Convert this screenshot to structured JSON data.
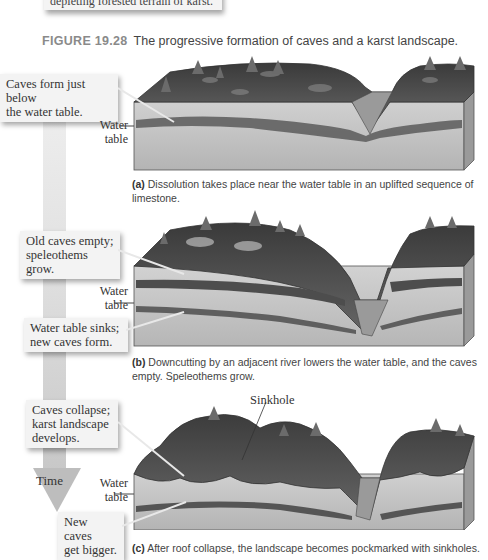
{
  "previous_box": {
    "text": "depleting forested terrain of karst."
  },
  "figure": {
    "number": "FIGURE 19.28",
    "title": "The progressive formation of caves and a karst landscape."
  },
  "time_arrow": {
    "label": "Time",
    "colors": {
      "top": "#eeeeee",
      "bottom": "#bdbdbd"
    }
  },
  "panels": [
    {
      "id": "a",
      "callouts": [
        {
          "line1": "Caves form just below",
          "line2": "the water table."
        }
      ],
      "water_table": {
        "line1": "Water",
        "line2": "table"
      },
      "caption": {
        "letter": "(a)",
        "text": " Dissolution takes place near the water table in an uplifted sequence of limestone."
      }
    },
    {
      "id": "b",
      "callouts": [
        {
          "line1": "Old caves empty;",
          "line2": "speleothems grow."
        },
        {
          "line1": "Water table sinks;",
          "line2": "new caves form."
        }
      ],
      "water_table": {
        "line1": "Water",
        "line2": "table"
      },
      "caption": {
        "letter": "(b)",
        "text": " Downcutting by an adjacent river lowers the water table, and the caves empty. Speleothems grow."
      }
    },
    {
      "id": "c",
      "callouts": [
        {
          "line1": "Caves collapse;",
          "line2": "karst landscape",
          "line3": "develops."
        },
        {
          "line1": "New caves",
          "line2": "get bigger."
        }
      ],
      "water_table": {
        "line1": "Water",
        "line2": "table"
      },
      "feature_label": "Sinkhole",
      "caption": {
        "letter": "(c)",
        "text": " After roof collapse, the landscape becomes pockmarked with sinkholes."
      }
    }
  ],
  "colors": {
    "ground_surface": "#4a4a4a",
    "limestone": "#bdbdbd",
    "limestone_light": "#d6d6d6",
    "cave_band": "#5a5a5a",
    "river": "#9a9a9a",
    "tree": "#6b6b6b"
  }
}
